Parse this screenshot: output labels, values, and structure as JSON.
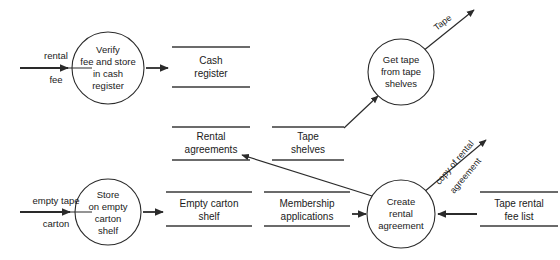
{
  "diagram": {
    "type": "data-flow-diagram",
    "canvas": {
      "width": 560,
      "height": 260
    },
    "colors": {
      "background": "#ffffff",
      "stroke": "#2b2b2b",
      "store_stroke": "#3a3a3a",
      "text": "#1a1a1a"
    }
  },
  "processes": [
    {
      "id": "verify-fee",
      "lines": [
        "Verify",
        "fee and store",
        "in cash",
        "register"
      ],
      "cx": 108,
      "cy": 68,
      "r": 36
    },
    {
      "id": "get-tape",
      "lines": [
        "Get tape",
        "from tape",
        "shelves"
      ],
      "cx": 401,
      "cy": 72,
      "r": 33
    },
    {
      "id": "store-carton",
      "lines": [
        "Store",
        "on empty",
        "carton",
        "shelf"
      ],
      "cx": 108,
      "cy": 212,
      "r": 33
    },
    {
      "id": "create-agreement",
      "lines": [
        "Create",
        "rental",
        "agreement"
      ],
      "cx": 401,
      "cy": 214,
      "r": 34
    }
  ],
  "data_stores": [
    {
      "id": "cash-register",
      "lines": [
        "Cash",
        "register"
      ],
      "x": 172,
      "y": 47,
      "width": 78,
      "height": 40
    },
    {
      "id": "rental-agreements",
      "lines": [
        "Rental",
        "agreements"
      ],
      "x": 172,
      "y": 127,
      "width": 78,
      "height": 33
    },
    {
      "id": "tape-shelves",
      "lines": [
        "Tape",
        "shelves"
      ],
      "x": 272,
      "y": 127,
      "width": 72,
      "height": 33
    },
    {
      "id": "empty-carton-shelf",
      "lines": [
        "Empty carton",
        "shelf"
      ],
      "x": 166,
      "y": 192,
      "width": 86,
      "height": 34
    },
    {
      "id": "membership-applications",
      "lines": [
        "Membership",
        "applications"
      ],
      "x": 264,
      "y": 192,
      "width": 86,
      "height": 34
    },
    {
      "id": "tape-rental-fee-list",
      "lines": [
        "Tape rental",
        "fee list"
      ],
      "x": 480,
      "y": 192,
      "width": 78,
      "height": 34
    }
  ],
  "flows": [
    {
      "id": "rental-fee",
      "lines": [
        "rental",
        "fee"
      ],
      "label_x": 56,
      "label_y": 56,
      "underlined": true
    },
    {
      "id": "empty-tape-carton",
      "lines": [
        "empty tape",
        "carton"
      ],
      "label_x": 56,
      "label_y": 201,
      "underlined": true
    },
    {
      "id": "tape-out",
      "lines": [
        "Tape"
      ],
      "label_x": 447,
      "label_y": 22,
      "rotation": -38
    },
    {
      "id": "copy-of-rental-agreement",
      "lines": [
        "copy of rental",
        "agreement"
      ],
      "label_x": 459,
      "label_y": 168,
      "rotation": -50
    }
  ]
}
